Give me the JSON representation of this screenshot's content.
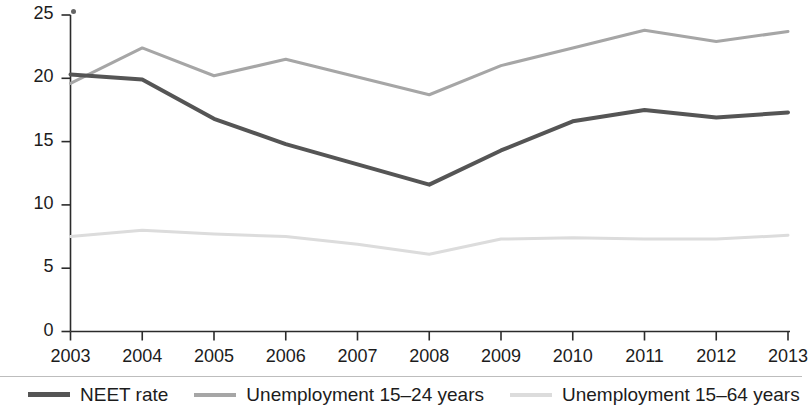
{
  "chart_data": {
    "type": "line",
    "title": "",
    "subtitle": "",
    "xlabel": "",
    "ylabel": "",
    "categories": [
      "2003",
      "2004",
      "2005",
      "2006",
      "2007",
      "2008",
      "2009",
      "2010",
      "2011",
      "2012",
      "2013"
    ],
    "x": [
      2003,
      2004,
      2005,
      2006,
      2007,
      2008,
      2009,
      2010,
      2011,
      2012,
      2013
    ],
    "series": [
      {
        "name": "NEET rate",
        "color": "#555555",
        "values": [
          20.3,
          19.9,
          16.8,
          14.8,
          13.2,
          11.6,
          14.3,
          16.6,
          17.5,
          16.9,
          17.3
        ]
      },
      {
        "name": "Unemployment 15–24 years",
        "color": "#a6a6a6",
        "values": [
          19.6,
          22.4,
          20.2,
          21.5,
          20.1,
          18.7,
          21.0,
          22.4,
          23.8,
          22.9,
          23.7
        ]
      },
      {
        "name": "Unemployment 15–64 years",
        "color": "#dcdcdc",
        "values": [
          7.5,
          8.0,
          7.7,
          7.5,
          6.9,
          6.1,
          7.3,
          7.4,
          7.3,
          7.3,
          7.6
        ]
      }
    ],
    "ylim": [
      0,
      25
    ],
    "yticks": [
      0,
      5,
      10,
      15,
      20,
      25
    ],
    "ytick_labels": [
      "0",
      "5",
      "10",
      "15",
      "20",
      "25"
    ],
    "xlim": [
      2003,
      2013
    ],
    "grid": false,
    "legend_position": "bottom"
  },
  "legend": {
    "items": [
      {
        "label": "NEET rate"
      },
      {
        "label": "Unemployment 15–24 years"
      },
      {
        "label": "Unemployment 15–64 years"
      }
    ]
  }
}
